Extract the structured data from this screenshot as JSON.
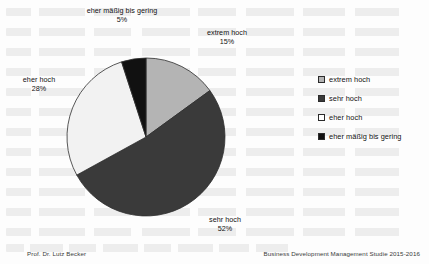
{
  "chart_data": {
    "type": "pie",
    "title": "",
    "categories": [
      "extrem hoch",
      "sehr hoch",
      "eher hoch",
      "eher mäßig bis gering"
    ],
    "values": [
      15,
      52,
      28,
      5
    ],
    "value_labels": [
      "15%",
      "52%",
      "28%",
      "5%"
    ],
    "unit": "%",
    "colors": [
      "#b4b4b4",
      "#3a3a3a",
      "#f2f2f2",
      "#111111"
    ],
    "legend_position": "right",
    "grid": false,
    "start_angle_deg": 0,
    "direction": "clockwise",
    "slice_labels": [
      {
        "name": "extrem hoch",
        "label": "extrem hoch",
        "pct": "15%"
      },
      {
        "name": "sehr hoch",
        "label": "sehr hoch",
        "pct": "52%"
      },
      {
        "name": "eher hoch",
        "label": "eher hoch",
        "pct": "28%"
      },
      {
        "name": "eher mäßig bis gering",
        "label": "eher mäßig bis gering",
        "pct": "5%"
      }
    ]
  },
  "legend": {
    "items": [
      {
        "label": "extrem hoch",
        "color": "#b4b4b4"
      },
      {
        "label": "sehr hoch",
        "color": "#3a3a3a"
      },
      {
        "label": "eher hoch",
        "color": "#ffffff"
      },
      {
        "label": "eher mäßig bis gering",
        "color": "#111111"
      }
    ]
  },
  "footer": {
    "left": "Prof. Dr. Lutz Becker",
    "right": "Business Development Management Studie 2015-2016"
  }
}
